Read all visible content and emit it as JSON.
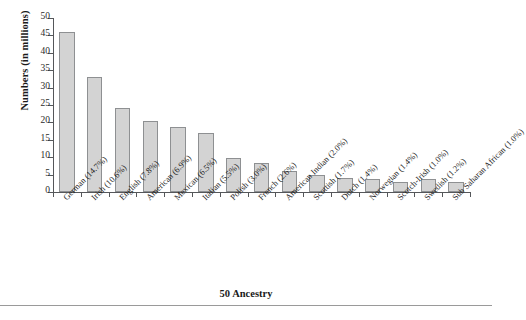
{
  "chart_data": {
    "type": "bar",
    "title": "",
    "xlabel": "50 Ancestry",
    "ylabel": "Numbers (in millions)",
    "ylim": [
      0,
      50
    ],
    "yticks": [
      0,
      5,
      10,
      15,
      20,
      25,
      30,
      35,
      40,
      45,
      50
    ],
    "grid": false,
    "legend": null,
    "bar_color": "#d3d3d3",
    "bar_edge_color": "#8e9092",
    "axis_color": "#55575a",
    "categories": [
      "German (14.7%)",
      "Irish (10.6%)",
      "English (7.8%)",
      "American (6.9%)",
      "Mexican (6.5%)",
      "Italian (5.5%)",
      "Polish (3.0%)",
      "French (2.6%)",
      "American Indian (2.0%)",
      "Scottish (1.7%)",
      "Dutch (1.4%)",
      "Norwegian (1.4%)",
      "Scotch-Irish (1.0%)",
      "Swedish (1.2%)",
      "Sub Saharan African (1.0%)"
    ],
    "values": [
      46.0,
      33.0,
      24.0,
      20.5,
      18.8,
      17.0,
      9.7,
      8.3,
      6.1,
      5.0,
      4.0,
      3.8,
      3.0,
      3.6,
      2.9
    ],
    "percentages": [
      14.7,
      10.6,
      7.8,
      6.9,
      6.5,
      5.5,
      3.0,
      2.6,
      2.0,
      1.7,
      1.4,
      1.4,
      1.0,
      1.2,
      1.0
    ]
  }
}
